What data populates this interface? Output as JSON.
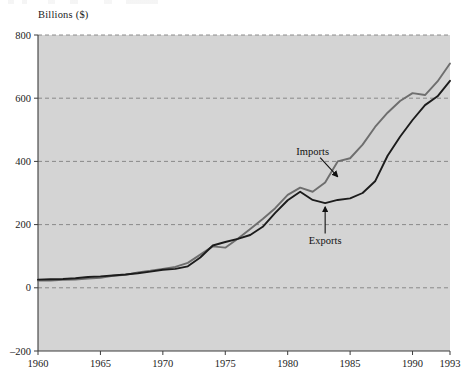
{
  "figure": {
    "y_axis_title": "Billions ($)",
    "colors": {
      "plot_background": "#d4d4d4",
      "grid": "#7c7c7c",
      "axis": "#3c3c3c",
      "imports_line": "#6e6e6e",
      "exports_line": "#1c1c1c",
      "text": "#1a1a1a"
    }
  },
  "chart_data": {
    "type": "line",
    "title": "",
    "subtitle": "",
    "xlabel": "",
    "ylabel": "Billions ($)",
    "xlim": [
      1960,
      1993
    ],
    "ylim": [
      -200,
      800
    ],
    "yticks": [
      -200,
      0,
      200,
      400,
      600,
      800
    ],
    "ytick_labels": [
      "–200",
      "0",
      "200",
      "400",
      "600",
      "800"
    ],
    "xticks": [
      1960,
      1965,
      1970,
      1975,
      1980,
      1985,
      1990,
      1993
    ],
    "xtick_labels": [
      "1960",
      "1965",
      "1970",
      "1975",
      "1980",
      "1985",
      "1990",
      "1993"
    ],
    "grid": "horizontal-dashed",
    "legend": "annotations",
    "annotations": [
      {
        "text": "Imports",
        "x": 1982.0,
        "y": 430,
        "arrow_from": [
          1982.6,
          412
        ],
        "arrow_to": [
          1984.0,
          352
        ]
      },
      {
        "text": "Exports",
        "x": 1983.0,
        "y": 150,
        "arrow_from": [
          1983.0,
          172
        ],
        "arrow_to": [
          1983.0,
          256
        ]
      }
    ],
    "series": [
      {
        "name": "Imports",
        "color": "#6e6e6e",
        "x": [
          1960,
          1961,
          1962,
          1963,
          1964,
          1965,
          1966,
          1967,
          1968,
          1969,
          1970,
          1971,
          1972,
          1973,
          1974,
          1975,
          1976,
          1977,
          1978,
          1979,
          1980,
          1981,
          1982,
          1983,
          1984,
          1985,
          1986,
          1987,
          1988,
          1989,
          1990,
          1991,
          1992,
          1993
        ],
        "values": [
          23,
          23,
          25,
          26,
          29,
          32,
          38,
          41,
          49,
          54,
          60,
          66,
          79,
          105,
          131,
          127,
          155,
          186,
          218,
          252,
          294,
          317,
          304,
          333,
          400,
          410,
          453,
          509,
          554,
          591,
          616,
          610,
          653,
          710
        ]
      },
      {
        "name": "Exports",
        "color": "#1c1c1c",
        "x": [
          1960,
          1961,
          1962,
          1963,
          1964,
          1965,
          1966,
          1967,
          1968,
          1969,
          1970,
          1971,
          1972,
          1973,
          1974,
          1975,
          1976,
          1977,
          1978,
          1979,
          1980,
          1981,
          1982,
          1983,
          1984,
          1985,
          1986,
          1987,
          1988,
          1989,
          1990,
          1991,
          1992,
          1993
        ],
        "values": [
          26,
          27,
          28,
          30,
          34,
          36,
          39,
          42,
          46,
          51,
          57,
          60,
          68,
          96,
          134,
          145,
          155,
          167,
          193,
          237,
          277,
          304,
          278,
          268,
          278,
          283,
          300,
          337,
          418,
          478,
          531,
          578,
          606,
          655
        ]
      }
    ]
  }
}
